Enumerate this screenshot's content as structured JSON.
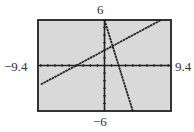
{
  "chart_data": {
    "type": "line",
    "title": "",
    "xlabel": "",
    "ylabel": "",
    "window": {
      "xmin": -9.4,
      "xmax": 9.4,
      "ymin": -6,
      "ymax": 6,
      "xscl": 1,
      "yscl": 1
    },
    "xlim": [
      -9.4,
      9.4
    ],
    "ylim": [
      -6,
      6
    ],
    "tick_labels": {
      "xmin": "−9.4",
      "xmax": "9.4",
      "ymax": "6",
      "ymin": "−6"
    },
    "grid": false,
    "axes_ticks": true,
    "series": [
      {
        "name": "line-1",
        "equation": "y = 0.5x + 2",
        "slope": 0.5,
        "intercept": 2,
        "x_range": [
          -9,
          8
        ]
      },
      {
        "name": "line-2",
        "equation": "y = -3x + 6",
        "slope": -3,
        "intercept": 6,
        "x_range": [
          0,
          4
        ]
      }
    ],
    "intersection": {
      "x": 1.14,
      "y": 2.57
    },
    "colors": {
      "background": "#d9d9d9",
      "frame": "#333333",
      "lines": "#222222"
    }
  }
}
